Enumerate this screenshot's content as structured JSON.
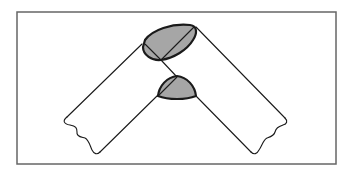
{
  "figure": {
    "description": "Line drawing of two bent tube/band segments meeting at a V-shaped joint, with two shaded elliptical cross-sections at the bend",
    "colors": {
      "background": "#ffffff",
      "frame": "#666666",
      "stroke": "#1a1a1a",
      "shading": "#a6a6a6"
    },
    "elements": [
      {
        "name": "left-band",
        "label": "Left band segment"
      },
      {
        "name": "right-band",
        "label": "Right band segment"
      },
      {
        "name": "upper-cross-section",
        "label": "Upper elliptical cross-section (shaded)"
      },
      {
        "name": "lower-cross-section",
        "label": "Lower dome cross-section (shaded)"
      }
    ]
  }
}
